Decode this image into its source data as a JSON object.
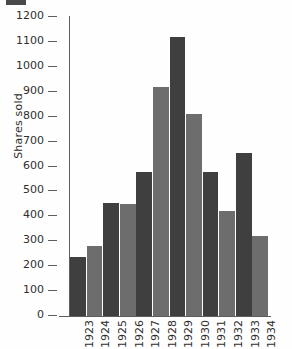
{
  "chart_data": {
    "type": "bar",
    "title": "",
    "subtitle": "",
    "xlabel": "",
    "ylabel": "Shares sold",
    "categories": [
      "1923",
      "1924",
      "1925",
      "1926",
      "1927",
      "1928",
      "1929",
      "1930",
      "1931",
      "1932",
      "1933",
      "1934"
    ],
    "values": [
      235,
      280,
      453,
      450,
      578,
      920,
      1120,
      810,
      578,
      423,
      655,
      323
    ],
    "series": [
      {
        "name": "Shares sold",
        "values": [
          235,
          280,
          453,
          450,
          578,
          920,
          1120,
          810,
          578,
          423,
          655,
          323
        ]
      }
    ],
    "bar_colors": [
      "#3f3f3f",
      "#6d6d6d",
      "#3f3f3f",
      "#6d6d6d",
      "#3f3f3f",
      "#6d6d6d",
      "#3f3f3f",
      "#6d6d6d",
      "#3f3f3f",
      "#6d6d6d",
      "#3f3f3f",
      "#6d6d6d"
    ],
    "ylim": [
      0,
      1200
    ],
    "ytick_values": [
      0,
      100,
      200,
      300,
      400,
      500,
      600,
      700,
      800,
      900,
      1000,
      1100,
      1200
    ],
    "ytick_labels": [
      "0",
      "100",
      "200",
      "300",
      "400",
      "500",
      "600",
      "700",
      "800",
      "900",
      "1000",
      "1100",
      "1200"
    ],
    "grid": false,
    "legend": false,
    "legend_position": "none",
    "annotations": [],
    "axis_color": "#5d5d5d",
    "text_color": "#2e2e2e",
    "background": "#ffffff"
  }
}
